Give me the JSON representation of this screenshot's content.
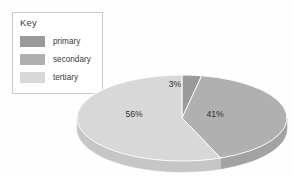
{
  "canvas": {
    "width": 293,
    "height": 178,
    "background": "#fefefe"
  },
  "legend": {
    "title": "Key",
    "border_color": "#c9c9c9",
    "items": [
      {
        "label": "primary",
        "color": "#9a9a9a"
      },
      {
        "label": "secondary",
        "color": "#b0b0b0"
      },
      {
        "label": "tertiary",
        "color": "#d8d8d8"
      }
    ]
  },
  "chart_data": {
    "type": "pie",
    "title": "",
    "subtitle": "",
    "xlabel": "",
    "ylabel": "",
    "three_d": true,
    "legend_position": "top-left",
    "grid": false,
    "categories": [
      "primary",
      "secondary",
      "tertiary"
    ],
    "values": [
      3,
      41,
      56
    ],
    "value_unit": "%",
    "data_labels": [
      "3%",
      "41%",
      "56%"
    ],
    "colors": [
      "#9a9a9a",
      "#b0b0b0",
      "#d8d8d8"
    ],
    "side_colors": [
      "#8a8a8a",
      "#a2a2a2",
      "#c6c6c6"
    ],
    "start_angle_deg": 0,
    "direction": "clockwise",
    "geometry": {
      "cx": 182,
      "cy": 118,
      "rx": 105,
      "ry": 43,
      "depth": 11
    },
    "label_positions": [
      {
        "label": "3%",
        "x": 175,
        "y": 87
      },
      {
        "label": "41%",
        "x": 215,
        "y": 117
      },
      {
        "label": "56%",
        "x": 134,
        "y": 117
      }
    ]
  }
}
